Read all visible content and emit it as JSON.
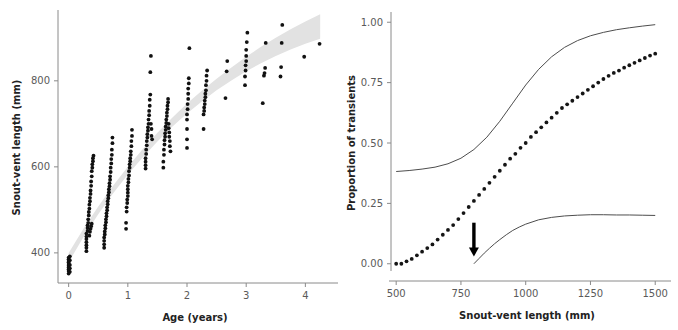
{
  "figure": {
    "background_color": "#ffffff",
    "panel_count": 2
  },
  "chart_data": [
    {
      "type": "scatter",
      "panel": "left",
      "title": "",
      "xlabel": "Age (years)",
      "ylabel": "Snout-vent length (mm)",
      "xlim": [
        -0.18,
        4.45
      ],
      "ylim": [
        330,
        960
      ],
      "xticks": [
        0,
        1,
        2,
        3,
        4
      ],
      "xtick_labels": [
        "0",
        "1",
        "2",
        "3",
        "4"
      ],
      "yticks": [
        400,
        600,
        800
      ],
      "ytick_labels": [
        "400",
        "600",
        "800"
      ],
      "grid": false,
      "legend": "none",
      "marker_color": "#111111",
      "band_color": "#e2e2e2",
      "band_label": "fitted growth curve with confidence band",
      "band_upper": [
        [
          0.0,
          400
        ],
        [
          0.25,
          456
        ],
        [
          0.5,
          508
        ],
        [
          0.75,
          556
        ],
        [
          1.0,
          600
        ],
        [
          1.25,
          641
        ],
        [
          1.5,
          679
        ],
        [
          1.75,
          714
        ],
        [
          2.0,
          747
        ],
        [
          2.25,
          777
        ],
        [
          2.5,
          805
        ],
        [
          2.75,
          831
        ],
        [
          3.0,
          856
        ],
        [
          3.25,
          879
        ],
        [
          3.5,
          900
        ],
        [
          3.75,
          920
        ],
        [
          4.0,
          938
        ],
        [
          4.25,
          955
        ]
      ],
      "band_lower": [
        [
          0.0,
          378
        ],
        [
          0.25,
          437
        ],
        [
          0.5,
          490
        ],
        [
          0.75,
          538
        ],
        [
          1.0,
          582
        ],
        [
          1.25,
          622
        ],
        [
          1.5,
          659
        ],
        [
          1.75,
          693
        ],
        [
          2.0,
          724
        ],
        [
          2.25,
          752
        ],
        [
          2.5,
          778
        ],
        [
          2.75,
          801
        ],
        [
          3.0,
          822
        ],
        [
          3.25,
          841
        ],
        [
          3.5,
          858
        ],
        [
          3.75,
          873
        ],
        [
          4.0,
          886
        ],
        [
          4.25,
          898
        ]
      ],
      "points": [
        [
          0.0,
          352
        ],
        [
          0.0,
          358
        ],
        [
          0.0,
          362
        ],
        [
          0.0,
          366
        ],
        [
          0.0,
          370
        ],
        [
          0.0,
          374
        ],
        [
          0.0,
          378
        ],
        [
          0.0,
          381
        ],
        [
          0.0,
          385
        ],
        [
          0.0,
          389
        ],
        [
          0.02,
          356
        ],
        [
          0.02,
          364
        ],
        [
          0.02,
          372
        ],
        [
          0.02,
          383
        ],
        [
          0.02,
          392
        ],
        [
          0.3,
          404
        ],
        [
          0.3,
          412
        ],
        [
          0.3,
          418
        ],
        [
          0.3,
          425
        ],
        [
          0.3,
          432
        ],
        [
          0.3,
          438
        ],
        [
          0.3,
          445
        ],
        [
          0.32,
          451
        ],
        [
          0.32,
          458
        ],
        [
          0.32,
          464
        ],
        [
          0.33,
          470
        ],
        [
          0.33,
          478
        ],
        [
          0.34,
          487
        ],
        [
          0.34,
          495
        ],
        [
          0.35,
          503
        ],
        [
          0.35,
          512
        ],
        [
          0.36,
          520
        ],
        [
          0.36,
          528
        ],
        [
          0.37,
          537
        ],
        [
          0.37,
          545
        ],
        [
          0.38,
          556
        ],
        [
          0.38,
          566
        ],
        [
          0.39,
          578
        ],
        [
          0.39,
          590
        ],
        [
          0.4,
          598
        ],
        [
          0.4,
          606
        ],
        [
          0.41,
          613
        ],
        [
          0.41,
          620
        ],
        [
          0.42,
          626
        ],
        [
          0.35,
          440
        ],
        [
          0.36,
          449
        ],
        [
          0.37,
          456
        ],
        [
          0.38,
          462
        ],
        [
          0.39,
          468
        ],
        [
          0.6,
          412
        ],
        [
          0.6,
          420
        ],
        [
          0.6,
          428
        ],
        [
          0.6,
          436
        ],
        [
          0.61,
          443
        ],
        [
          0.61,
          450
        ],
        [
          0.62,
          457
        ],
        [
          0.62,
          464
        ],
        [
          0.63,
          471
        ],
        [
          0.63,
          478
        ],
        [
          0.64,
          485
        ],
        [
          0.64,
          492
        ],
        [
          0.65,
          499
        ],
        [
          0.65,
          506
        ],
        [
          0.66,
          513
        ],
        [
          0.66,
          520
        ],
        [
          0.67,
          527
        ],
        [
          0.67,
          534
        ],
        [
          0.68,
          541
        ],
        [
          0.68,
          548
        ],
        [
          0.69,
          555
        ],
        [
          0.69,
          562
        ],
        [
          0.7,
          570
        ],
        [
          0.7,
          578
        ],
        [
          0.71,
          588
        ],
        [
          0.71,
          598
        ],
        [
          0.72,
          608
        ],
        [
          0.72,
          618
        ],
        [
          0.73,
          628
        ],
        [
          0.73,
          640
        ],
        [
          0.74,
          655
        ],
        [
          0.74,
          668
        ],
        [
          0.97,
          456
        ],
        [
          0.97,
          470
        ],
        [
          0.98,
          496
        ],
        [
          0.98,
          506
        ],
        [
          0.99,
          516
        ],
        [
          0.99,
          524
        ],
        [
          1.0,
          532
        ],
        [
          1.0,
          540
        ],
        [
          1.0,
          548
        ],
        [
          1.0,
          556
        ],
        [
          1.01,
          564
        ],
        [
          1.01,
          572
        ],
        [
          1.02,
          580
        ],
        [
          1.02,
          590
        ],
        [
          1.03,
          598
        ],
        [
          1.03,
          606
        ],
        [
          1.04,
          613
        ],
        [
          1.04,
          620
        ],
        [
          1.05,
          628
        ],
        [
          1.05,
          636
        ],
        [
          1.06,
          648
        ],
        [
          1.06,
          660
        ],
        [
          1.07,
          672
        ],
        [
          1.07,
          686
        ],
        [
          1.3,
          596
        ],
        [
          1.3,
          604
        ],
        [
          1.3,
          612
        ],
        [
          1.3,
          620
        ],
        [
          1.31,
          630
        ],
        [
          1.31,
          640
        ],
        [
          1.32,
          650
        ],
        [
          1.32,
          660
        ],
        [
          1.33,
          668
        ],
        [
          1.33,
          676
        ],
        [
          1.34,
          684
        ],
        [
          1.34,
          692
        ],
        [
          1.35,
          700
        ],
        [
          1.35,
          710
        ],
        [
          1.36,
          720
        ],
        [
          1.36,
          730
        ],
        [
          1.37,
          742
        ],
        [
          1.37,
          756
        ],
        [
          1.38,
          768
        ],
        [
          1.38,
          820
        ],
        [
          1.39,
          858
        ],
        [
          1.39,
          700
        ],
        [
          1.4,
          688
        ],
        [
          1.4,
          672
        ],
        [
          1.41,
          664
        ],
        [
          1.6,
          598
        ],
        [
          1.6,
          612
        ],
        [
          1.61,
          628
        ],
        [
          1.61,
          640
        ],
        [
          1.62,
          652
        ],
        [
          1.62,
          662
        ],
        [
          1.63,
          670
        ],
        [
          1.63,
          678
        ],
        [
          1.64,
          686
        ],
        [
          1.64,
          694
        ],
        [
          1.65,
          702
        ],
        [
          1.65,
          710
        ],
        [
          1.66,
          718
        ],
        [
          1.66,
          726
        ],
        [
          1.67,
          734
        ],
        [
          1.67,
          742
        ],
        [
          1.68,
          750
        ],
        [
          1.68,
          758
        ],
        [
          1.69,
          700
        ],
        [
          1.69,
          690
        ],
        [
          1.7,
          680
        ],
        [
          1.7,
          670
        ],
        [
          1.71,
          660
        ],
        [
          1.71,
          648
        ],
        [
          1.72,
          636
        ],
        [
          2.0,
          644
        ],
        [
          2.0,
          664
        ],
        [
          2.0,
          688
        ],
        [
          2.0,
          710
        ],
        [
          2.0,
          722
        ],
        [
          2.01,
          734
        ],
        [
          2.01,
          746
        ],
        [
          2.02,
          758
        ],
        [
          2.02,
          770
        ],
        [
          2.02,
          782
        ],
        [
          2.03,
          794
        ],
        [
          2.03,
          806
        ],
        [
          2.04,
          876
        ],
        [
          2.28,
          688
        ],
        [
          2.28,
          722
        ],
        [
          2.29,
          730
        ],
        [
          2.29,
          738
        ],
        [
          2.3,
          746
        ],
        [
          2.3,
          754
        ],
        [
          2.31,
          762
        ],
        [
          2.31,
          770
        ],
        [
          2.32,
          778
        ],
        [
          2.32,
          790
        ],
        [
          2.33,
          800
        ],
        [
          2.33,
          812
        ],
        [
          2.34,
          824
        ],
        [
          2.65,
          760
        ],
        [
          2.67,
          822
        ],
        [
          2.68,
          846
        ],
        [
          2.98,
          790
        ],
        [
          2.98,
          810
        ],
        [
          2.99,
          824
        ],
        [
          2.99,
          836
        ],
        [
          3.0,
          846
        ],
        [
          3.0,
          858
        ],
        [
          3.0,
          872
        ],
        [
          3.01,
          890
        ],
        [
          3.02,
          912
        ],
        [
          3.28,
          748
        ],
        [
          3.3,
          812
        ],
        [
          3.31,
          818
        ],
        [
          3.32,
          830
        ],
        [
          3.33,
          888
        ],
        [
          3.58,
          810
        ],
        [
          3.59,
          832
        ],
        [
          3.6,
          888
        ],
        [
          3.61,
          930
        ],
        [
          3.98,
          856
        ],
        [
          4.24,
          886
        ]
      ]
    },
    {
      "type": "line",
      "panel": "right",
      "title": "",
      "xlabel": "Snout-vent length (mm)",
      "ylabel": "Proportion of transients",
      "xlim": [
        480,
        1530
      ],
      "ylim": [
        -0.03,
        1.03
      ],
      "xticks": [
        500,
        750,
        1000,
        1250,
        1500
      ],
      "xtick_labels": [
        "500",
        "750",
        "1000",
        "1250",
        "1500"
      ],
      "yticks": [
        0.0,
        0.25,
        0.5,
        0.75,
        1.0
      ],
      "ytick_labels": [
        "0.00",
        "0.25",
        "0.50",
        "0.75",
        "1.00"
      ],
      "grid": false,
      "legend": "none",
      "annotations": [
        {
          "name": "arrow-annotation",
          "shape": "down-arrow",
          "x": 800,
          "y_top": 0.17,
          "y_bottom": 0.03,
          "color": "#000000"
        }
      ],
      "series": [
        {
          "name": "fitted proportion (dotted)",
          "style": "dotted",
          "color": "#151515",
          "x": [
            500,
            520,
            540,
            560,
            580,
            600,
            620,
            640,
            660,
            680,
            700,
            720,
            740,
            760,
            780,
            800,
            820,
            840,
            860,
            880,
            900,
            920,
            940,
            960,
            980,
            1000,
            1020,
            1040,
            1060,
            1080,
            1100,
            1120,
            1140,
            1160,
            1180,
            1200,
            1220,
            1240,
            1260,
            1280,
            1300,
            1320,
            1340,
            1360,
            1380,
            1400,
            1420,
            1440,
            1460,
            1480,
            1500
          ],
          "y": [
            0.0,
            0.0,
            0.01,
            0.02,
            0.035,
            0.05,
            0.065,
            0.08,
            0.1,
            0.12,
            0.14,
            0.16,
            0.185,
            0.21,
            0.235,
            0.26,
            0.285,
            0.31,
            0.335,
            0.36,
            0.385,
            0.41,
            0.435,
            0.455,
            0.48,
            0.5,
            0.525,
            0.545,
            0.565,
            0.585,
            0.605,
            0.625,
            0.645,
            0.66,
            0.675,
            0.69,
            0.705,
            0.72,
            0.735,
            0.75,
            0.765,
            0.778,
            0.79,
            0.8,
            0.812,
            0.822,
            0.832,
            0.842,
            0.852,
            0.862,
            0.87
          ]
        },
        {
          "name": "upper confidence limit",
          "style": "solid",
          "color": "#4d4d4d",
          "x": [
            500,
            550,
            600,
            650,
            700,
            750,
            800,
            850,
            900,
            950,
            1000,
            1050,
            1100,
            1150,
            1200,
            1250,
            1300,
            1350,
            1400,
            1450,
            1500
          ],
          "y": [
            0.382,
            0.386,
            0.392,
            0.4,
            0.414,
            0.437,
            0.473,
            0.524,
            0.59,
            0.665,
            0.74,
            0.805,
            0.857,
            0.896,
            0.924,
            0.944,
            0.958,
            0.969,
            0.977,
            0.984,
            0.99
          ]
        },
        {
          "name": "lower confidence limit",
          "style": "solid",
          "color": "#4d4d4d",
          "x": [
            800,
            820,
            840,
            860,
            880,
            900,
            925,
            950,
            975,
            1000,
            1050,
            1100,
            1150,
            1200,
            1250,
            1300,
            1350,
            1400,
            1450,
            1500
          ],
          "y": [
            0.0,
            0.022,
            0.044,
            0.064,
            0.083,
            0.1,
            0.12,
            0.138,
            0.152,
            0.164,
            0.182,
            0.192,
            0.198,
            0.201,
            0.203,
            0.203,
            0.202,
            0.202,
            0.201,
            0.2
          ]
        }
      ]
    }
  ]
}
